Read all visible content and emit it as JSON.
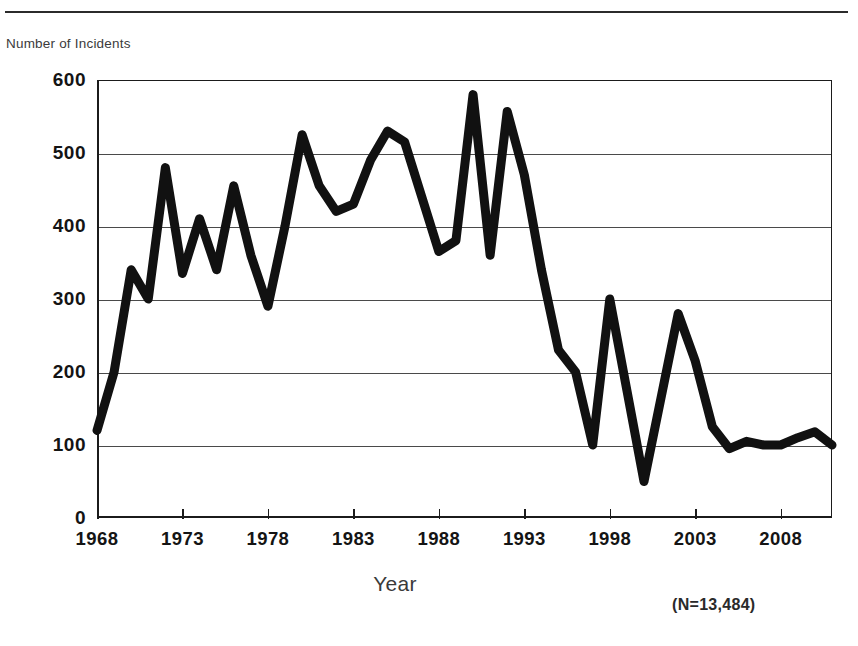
{
  "page": {
    "y_axis_caption": "Number of Incidents",
    "x_axis_title": "Year",
    "note": "(N=13,484)"
  },
  "axes": {
    "y_ticks": [
      "600",
      "500",
      "400",
      "300",
      "200",
      "100",
      "0"
    ],
    "x_ticks": [
      "1968",
      "1973",
      "1978",
      "1983",
      "1988",
      "1993",
      "1998",
      "2003",
      "2008"
    ]
  },
  "chart_data": {
    "type": "line",
    "title": "",
    "subtitle": "",
    "xlabel": "Year",
    "ylabel": "Number of Incidents",
    "annotation": "(N=13,484)",
    "xlim": [
      1968,
      2011
    ],
    "ylim": [
      0,
      600
    ],
    "grid": true,
    "legend": "none",
    "x_tick_labels": [
      "1968",
      "1973",
      "1978",
      "1983",
      "1988",
      "1993",
      "1998",
      "2003",
      "2008"
    ],
    "x_tick_values": [
      1968,
      1973,
      1978,
      1983,
      1988,
      1993,
      1998,
      2003,
      2008
    ],
    "y_tick_values": [
      0,
      100,
      200,
      300,
      400,
      500,
      600
    ],
    "series": [
      {
        "name": "Number of Incidents",
        "color": "#111111",
        "line_width": 9,
        "x": [
          1968,
          1969,
          1970,
          1971,
          1972,
          1973,
          1974,
          1975,
          1976,
          1977,
          1978,
          1979,
          1980,
          1981,
          1982,
          1983,
          1984,
          1985,
          1986,
          1987,
          1988,
          1989,
          1990,
          1991,
          1992,
          1993,
          1994,
          1995,
          1996,
          1997,
          1998,
          1999,
          2000,
          2001,
          2002,
          2003,
          2004,
          2005,
          2006,
          2007,
          2008,
          2009,
          2010,
          2011
        ],
        "values": [
          120,
          200,
          340,
          300,
          480,
          335,
          410,
          340,
          455,
          360,
          290,
          400,
          525,
          455,
          420,
          430,
          490,
          530,
          515,
          440,
          365,
          380,
          580,
          360,
          557,
          470,
          340,
          230,
          200,
          100,
          300,
          175,
          50,
          165,
          280,
          215,
          125,
          95,
          105,
          100,
          100,
          110,
          118,
          100
        ]
      }
    ]
  }
}
